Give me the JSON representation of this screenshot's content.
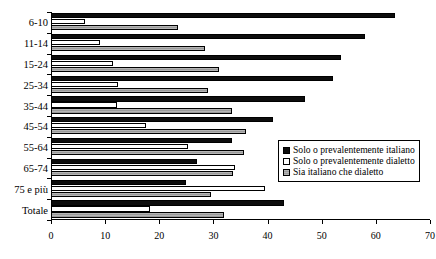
{
  "chart_data": {
    "type": "bar",
    "orientation": "horizontal",
    "title": "",
    "xlabel": "",
    "ylabel": "",
    "xlim": [
      0,
      70
    ],
    "xticks": [
      0,
      10,
      20,
      30,
      40,
      50,
      60,
      70
    ],
    "grid": false,
    "legend_position": "right",
    "categories": [
      "6-10",
      "11-14",
      "15-24",
      "25-34",
      "35-44",
      "45-54",
      "55-64",
      "65-74",
      "75 e più",
      "Totale"
    ],
    "series": [
      {
        "name": "Solo o prevalentemente italiano",
        "color": "#0d0d0d",
        "values": [
          63.5,
          58.0,
          53.5,
          52.0,
          47.0,
          41.0,
          33.5,
          27.0,
          25.0,
          43.0
        ]
      },
      {
        "name": "Solo o prevalentemente dialetto",
        "color": "#ffffff",
        "values": [
          6.3,
          9.0,
          11.5,
          12.4,
          12.2,
          17.6,
          25.3,
          34.0,
          39.5,
          18.3
        ]
      },
      {
        "name": "Sia italiano che dialetto",
        "color": "#a8a8a8",
        "values": [
          23.5,
          28.5,
          31.0,
          29.0,
          33.5,
          36.0,
          35.7,
          33.6,
          29.5,
          32.0
        ]
      }
    ]
  },
  "legend": {
    "items": [
      {
        "label": "Solo o prevalentemente italiano",
        "swatch": "black-square-icon"
      },
      {
        "label": "Solo o prevalentemente dialetto",
        "swatch": "white-square-icon"
      },
      {
        "label": "Sia italiano che dialetto",
        "swatch": "gray-square-icon"
      }
    ]
  }
}
